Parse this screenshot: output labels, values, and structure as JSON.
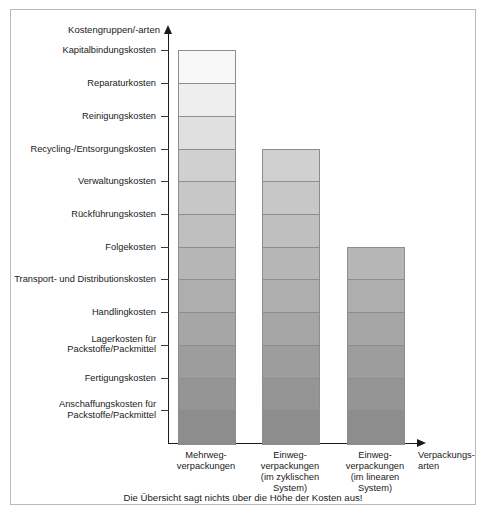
{
  "chart_data": {
    "type": "bar",
    "title": "",
    "ylabel": "Kostengruppen/-arten",
    "xlabel": "Verpackungs-\narten",
    "caption": "Die Übersicht sagt nichts über die Höhe der Kosten aus!",
    "note": "Stacked qualitative chart: each packaging type is built from a stack of cost categories, counted from the bottom upward. Segment heights are uniform (~32.7 px each); no numeric scale is given.",
    "grid": false,
    "legend": false,
    "categories": [
      "Mehrweg-\nverpackungen",
      "Einweg-\nverpackungen\n(im zyklischen\nSystem)",
      "Einweg-\nverpackungen\n(im linearen\nSystem)"
    ],
    "values": [
      12,
      9,
      6
    ],
    "value_unit": "Anzahl der Kostengruppen/-arten",
    "cost_categories_bottom_to_top": [
      "Anschaffungskosten für Packstoffe/Packmittel",
      "Fertigungskosten",
      "Lagerkosten für Packstoffe/Packmittel",
      "Handlingkosten",
      "Transport- und Distributionskosten",
      "Folgekosten",
      "Rückführungskosten",
      "Verwaltungskosten",
      "Recycling-/Entsorgungskosten",
      "Reinigungskosten",
      "Reparaturkosten",
      "Kapitalbindungskosten"
    ],
    "y_axis_labels_top_to_bottom": [
      "Kapitalbindungskosten",
      "Reparaturkosten",
      "Reinigungskosten",
      "Recycling-/Entsorgungskosten",
      "Verwaltungskosten",
      "Rückführungskosten",
      "Folgekosten",
      "Transport- und Distributionskosten",
      "Handlingkosten",
      "Lagerkosten für\nPackstoffe/Packmittel",
      "Fertigungskosten",
      "Anschaffungskosten für\nPackstoffe/Packmittel"
    ],
    "segment_colors_bottom_to_top": [
      "#8d8d8d",
      "#959595",
      "#9d9d9d",
      "#a6a6a6",
      "#aeaeae",
      "#b6b6b6",
      "#bfbfbf",
      "#c7c7c7",
      "#d0d0d0",
      "#e0e0e0",
      "#eeeeee",
      "#f8f8f8"
    ],
    "series": [
      {
        "name": "Mehrwegverpackungen",
        "value": 12,
        "segments_bottom_to_top": [
          "Anschaffungskosten für Packstoffe/Packmittel",
          "Fertigungskosten",
          "Lagerkosten für Packstoffe/Packmittel",
          "Handlingkosten",
          "Transport- und Distributionskosten",
          "Folgekosten",
          "Rückführungskosten",
          "Verwaltungskosten",
          "Recycling-/Entsorgungskosten",
          "Reinigungskosten",
          "Reparaturkosten",
          "Kapitalbindungskosten"
        ]
      },
      {
        "name": "Einwegverpackungen (im zyklischen System)",
        "value": 9,
        "segments_bottom_to_top": [
          "Anschaffungskosten für Packstoffe/Packmittel",
          "Fertigungskosten",
          "Lagerkosten für Packstoffe/Packmittel",
          "Handlingkosten",
          "Transport- und Distributionskosten",
          "Folgekosten",
          "Rückführungskosten",
          "Verwaltungskosten",
          "Recycling-/Entsorgungskosten"
        ]
      },
      {
        "name": "Einwegverpackungen (im linearen System)",
        "value": 6,
        "segments_bottom_to_top": [
          "Anschaffungskosten für Packstoffe/Packmittel",
          "Fertigungskosten",
          "Lagerkosten für Packstoffe/Packmittel",
          "Handlingkosten",
          "Transport- und Distributionskosten",
          "Folgekosten"
        ]
      }
    ]
  }
}
